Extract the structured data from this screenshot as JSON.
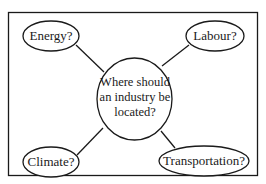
{
  "diagram": {
    "center": {
      "lines": [
        "Where should",
        "an industry be",
        "located?"
      ]
    },
    "nodes": [
      {
        "id": "energy",
        "label": "Energy?"
      },
      {
        "id": "labour",
        "label": "Labour?"
      },
      {
        "id": "climate",
        "label": "Climate?"
      },
      {
        "id": "transportation",
        "label": "Transportation?"
      }
    ],
    "colors": {
      "stroke": "#1a1a1a",
      "background": "#ffffff"
    }
  }
}
